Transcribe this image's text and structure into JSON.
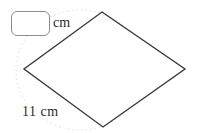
{
  "figure": {
    "type": "rhombus-diagram",
    "stroke_color": "#3a3a3a",
    "guide_color": "#d9d9d9",
    "background": "#ffffff",
    "width": 198,
    "height": 133,
    "shape": {
      "name": "rhombus",
      "vertices": [
        {
          "label": "top",
          "x": 102,
          "y": 12
        },
        {
          "label": "right",
          "x": 185,
          "y": 69
        },
        {
          "label": "bottom",
          "x": 103,
          "y": 127
        },
        {
          "label": "left",
          "x": 24,
          "y": 69
        }
      ]
    },
    "guide_ellipse": {
      "cx": 80,
      "cy": 70,
      "rx": 64,
      "ry": 60,
      "style": "dotted"
    }
  },
  "answer_input": {
    "value": "",
    "placeholder": "",
    "unit_label": "cm"
  },
  "known_side": {
    "measure": "11",
    "unit": "cm",
    "label": "11 cm"
  }
}
